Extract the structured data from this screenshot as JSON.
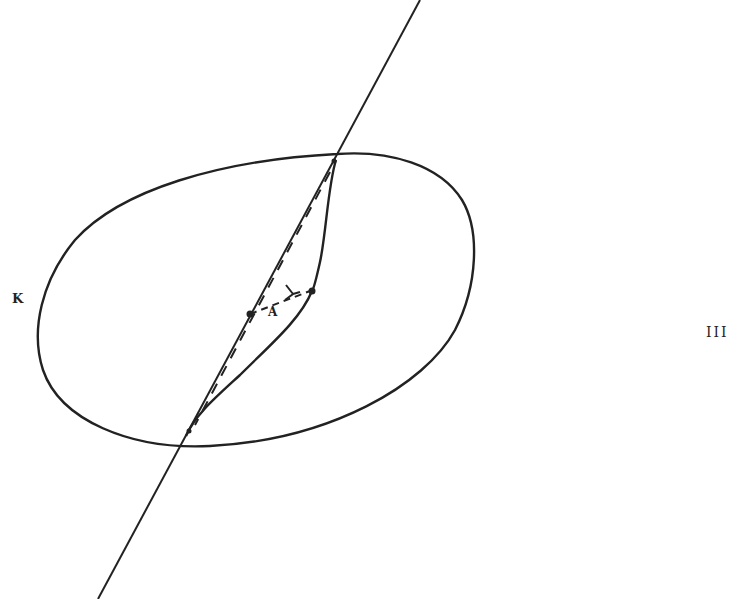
{
  "figure": {
    "labels": {
      "curve_label": "K",
      "point_label": "A",
      "figure_number": "III"
    },
    "colors": {
      "ink": "#222222",
      "background": "#ffffff"
    },
    "elements": {
      "closed_curve": "K (oval-shaped closed curve)",
      "straight_line": "secant line crossing K at two points",
      "s_curve": "solid arc joining the two intersection points inside K",
      "dashed_chord": "dashed segment between the two intersection points",
      "dashed_arrow": "dashed path from A to a point on the S-curve, with arrowhead"
    }
  }
}
